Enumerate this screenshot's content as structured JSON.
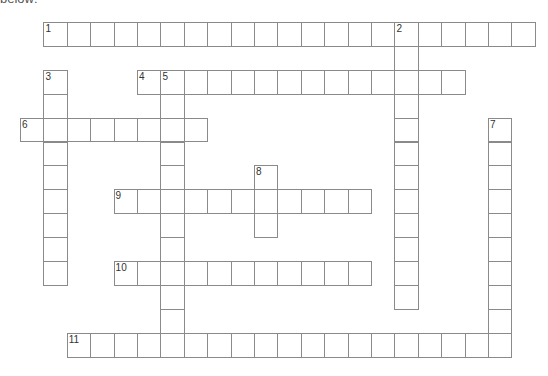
{
  "header": {
    "fragment_text": "below:"
  },
  "grid": {
    "origin_x": 20,
    "origin_y": 22,
    "cell_w": 23.4,
    "cell_h": 23.9,
    "border_color": "#8a8a8a"
  },
  "words": [
    {
      "number": "1",
      "direction": "across",
      "row": 0,
      "col": 1,
      "length": 21
    },
    {
      "number": "2",
      "direction": "down",
      "row": 0,
      "col": 16,
      "length": 12
    },
    {
      "number": "3",
      "direction": "down",
      "row": 2,
      "col": 1,
      "length": 9
    },
    {
      "number": "4",
      "direction": "across",
      "row": 2,
      "col": 5,
      "length": 14
    },
    {
      "number": "5",
      "direction": "down",
      "row": 2,
      "col": 6,
      "length": 12
    },
    {
      "number": "6",
      "direction": "across",
      "row": 4,
      "col": 0,
      "length": 8
    },
    {
      "number": "7",
      "direction": "down",
      "row": 4,
      "col": 20,
      "length": 10
    },
    {
      "number": "8",
      "direction": "down",
      "row": 6,
      "col": 10,
      "length": 3
    },
    {
      "number": "9",
      "direction": "across",
      "row": 7,
      "col": 4,
      "length": 11
    },
    {
      "number": "10",
      "direction": "across",
      "row": 10,
      "col": 4,
      "length": 11
    },
    {
      "number": "11",
      "direction": "across",
      "row": 13,
      "col": 2,
      "length": 19
    }
  ]
}
